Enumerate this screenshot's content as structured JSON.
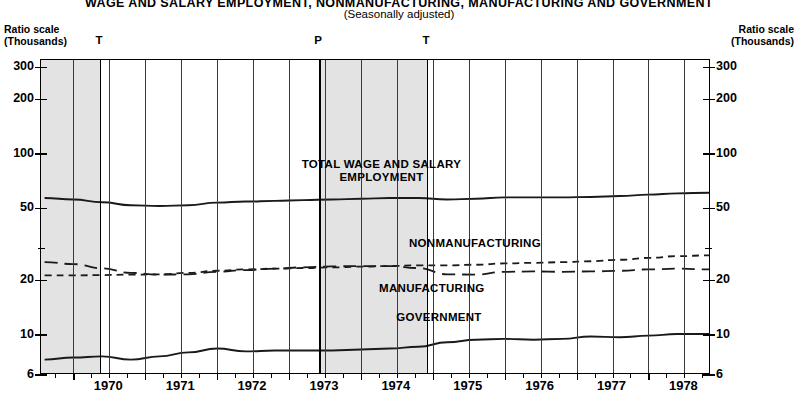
{
  "header": {
    "title": "WAGE AND SALARY EMPLOYMENT, NONMANUFACTURING, MANUFACTURING AND GOVERNMENT",
    "subtitle": "(Seasonally adjusted)",
    "axis_caption_line1": "Ratio scale",
    "axis_caption_line2": "(Thousands)"
  },
  "chart_data": {
    "type": "line",
    "title": "WAGE AND SALARY EMPLOYMENT, NONMANUFACTURING, MANUFACTURING AND GOVERNMENT",
    "subtitle": "(Seasonally adjusted)",
    "xlabel": "",
    "ylabel": "Ratio scale (Thousands)",
    "yscale": "log",
    "ylim": [
      6,
      330
    ],
    "ytick_labels": [
      "300",
      "200",
      "100",
      "50",
      "20",
      "10",
      "6"
    ],
    "ytick_values": [
      300,
      200,
      100,
      50,
      20,
      10,
      6
    ],
    "yminor_values": [
      30
    ],
    "xtick_labels": [
      "1970",
      "1971",
      "1972",
      "1973",
      "1974",
      "1975",
      "1976",
      "1977",
      "1978"
    ],
    "x_start": 1969.55,
    "x_end": 1978.87,
    "grid": true,
    "legend": "inline-annotations",
    "recession_bands": [
      {
        "start": 1969.55,
        "end": 1970.37,
        "label": "T",
        "marker_x": 1970.37
      },
      {
        "start": 1973.42,
        "end": 1974.92,
        "label_start": "P",
        "label_end": "T",
        "marker_p": 1973.42,
        "marker_t": 1974.92
      }
    ],
    "cycle_markers": [
      {
        "label": "T",
        "x": 1970.37
      },
      {
        "label": "P",
        "x": 1973.42
      },
      {
        "label": "T",
        "x": 1974.92
      }
    ],
    "series": [
      {
        "name": "TOTAL WAGE AND SALARY EMPLOYMENT",
        "style": "solid",
        "label_x": 1974.3,
        "label_y": 86,
        "x": [
          1969.6,
          1970.0,
          1970.4,
          1970.8,
          1971.2,
          1971.6,
          1972.0,
          1972.4,
          1972.8,
          1973.2,
          1973.6,
          1974.0,
          1974.4,
          1974.8,
          1975.2,
          1975.6,
          1976.0,
          1976.4,
          1976.8,
          1977.2,
          1977.6,
          1978.0,
          1978.4,
          1978.85
        ],
        "values": [
          57.0,
          56.0,
          54.0,
          52.0,
          51.5,
          52.0,
          53.8,
          54.5,
          55.0,
          55.5,
          56.0,
          56.5,
          57.0,
          57.0,
          56.0,
          56.5,
          57.5,
          57.5,
          57.5,
          57.8,
          58.5,
          59.5,
          60.5,
          61.0
        ]
      },
      {
        "name": "NONMANUFACTURING",
        "style": "dashed-short",
        "label_x": 1975.6,
        "label_y": 31.5,
        "x": [
          1969.6,
          1970.0,
          1970.4,
          1970.8,
          1971.2,
          1971.6,
          1972.0,
          1972.4,
          1972.8,
          1973.2,
          1973.6,
          1974.0,
          1974.4,
          1974.8,
          1975.2,
          1975.6,
          1976.0,
          1976.4,
          1976.8,
          1977.2,
          1977.6,
          1978.0,
          1978.4,
          1978.85
        ],
        "values": [
          21.3,
          21.3,
          21.4,
          21.5,
          21.6,
          22.0,
          22.6,
          23.0,
          23.2,
          23.4,
          23.6,
          23.8,
          24.0,
          24.2,
          24.2,
          24.4,
          24.8,
          25.0,
          25.2,
          25.5,
          26.0,
          26.6,
          27.2,
          27.5
        ]
      },
      {
        "name": "MANUFACTURING",
        "style": "dashed-long",
        "label_x": 1975.0,
        "label_y": 17.6,
        "x": [
          1969.6,
          1970.0,
          1970.4,
          1970.8,
          1971.2,
          1971.6,
          1972.0,
          1972.4,
          1972.8,
          1973.2,
          1973.6,
          1974.0,
          1974.4,
          1974.8,
          1975.2,
          1975.6,
          1976.0,
          1976.4,
          1976.8,
          1977.2,
          1977.6,
          1978.0,
          1978.4,
          1978.85
        ],
        "values": [
          25.2,
          24.6,
          23.3,
          22.0,
          21.5,
          21.6,
          22.3,
          22.8,
          23.2,
          23.6,
          23.9,
          24.0,
          24.0,
          23.4,
          21.6,
          21.5,
          22.3,
          22.4,
          22.3,
          22.4,
          22.6,
          23.0,
          23.2,
          23.0
        ]
      },
      {
        "name": "GOVERNMENT",
        "style": "solid",
        "label_x": 1975.1,
        "label_y": 12.3,
        "x": [
          1969.6,
          1970.0,
          1970.4,
          1970.8,
          1971.2,
          1971.6,
          1972.0,
          1972.4,
          1972.8,
          1973.2,
          1973.6,
          1974.0,
          1974.4,
          1974.8,
          1975.2,
          1975.6,
          1976.0,
          1976.4,
          1976.8,
          1977.2,
          1977.6,
          1978.0,
          1978.4,
          1978.85
        ],
        "values": [
          7.3,
          7.5,
          7.6,
          7.3,
          7.6,
          8.0,
          8.4,
          8.1,
          8.2,
          8.2,
          8.2,
          8.3,
          8.4,
          8.6,
          9.1,
          9.4,
          9.5,
          9.4,
          9.5,
          9.8,
          9.7,
          9.9,
          10.1,
          10.1
        ]
      }
    ]
  }
}
